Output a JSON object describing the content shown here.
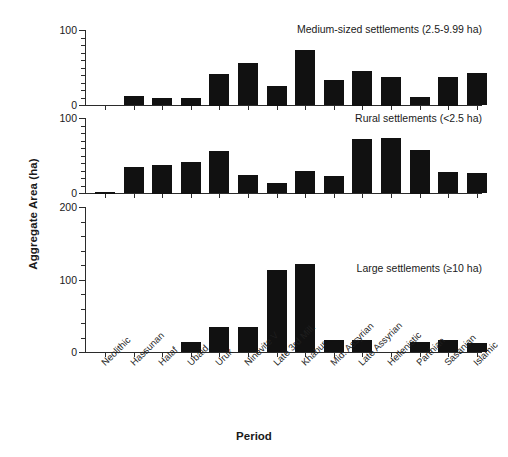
{
  "chart_data": {
    "type": "bar",
    "title": "",
    "xlabel": "Period",
    "ylabel": "Aggregate Area (ha)",
    "grid": false,
    "legend": "none",
    "categories": [
      "Neolithic",
      "Hassunan",
      "Halaf",
      "Ubaid",
      "Uruk",
      "Ninevite V",
      "Late 3rd Mill.",
      "Khabur",
      "Mid. Assyrian",
      "Late Assyrian",
      "Hellenistic",
      "Parthian",
      "Sasanian",
      "Islamic"
    ],
    "panels": [
      {
        "caption": "Medium-sized settlements (2.5-9.99 ha)",
        "ylim": [
          0,
          100
        ],
        "yticks": [
          0,
          100
        ],
        "ytick_labels": [
          "0",
          "100"
        ],
        "minor_tick_step": 10,
        "values": [
          0,
          12,
          9,
          10,
          42,
          56,
          26,
          73,
          33,
          46,
          38,
          11,
          38,
          43
        ]
      },
      {
        "caption": "Rural settlements (<2.5 ha)",
        "ylim": [
          0,
          100
        ],
        "yticks": [
          0,
          100
        ],
        "ytick_labels": [
          "0",
          "100"
        ],
        "minor_tick_step": 10,
        "values": [
          2,
          35,
          38,
          42,
          56,
          24,
          13,
          30,
          23,
          72,
          73,
          58,
          28,
          27
        ]
      },
      {
        "caption": "Large settlements (≥10 ha)",
        "ylim": [
          0,
          200
        ],
        "yticks": [
          0,
          100,
          200
        ],
        "ytick_labels": [
          "0",
          "100",
          "200"
        ],
        "minor_tick_step": 20,
        "values": [
          0,
          0,
          0,
          14,
          34,
          35,
          113,
          122,
          17,
          17,
          0,
          14,
          17,
          13
        ]
      }
    ],
    "colors": {
      "bar": "#111111",
      "axis": "#2b2b2b",
      "background": "#ffffff",
      "text": "#1a1a1a"
    }
  }
}
